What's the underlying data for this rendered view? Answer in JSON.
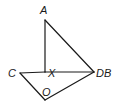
{
  "diagram": {
    "type": "geometry",
    "points": {
      "A": {
        "label": "A",
        "x": 45,
        "y": 20
      },
      "X": {
        "label": "X",
        "x": 45,
        "y": 72
      },
      "C": {
        "label": "C",
        "x": 20,
        "y": 73
      },
      "DB": {
        "label": "DB",
        "x": 94,
        "y": 72
      },
      "O": {
        "label": "O",
        "x": 45,
        "y": 100
      }
    },
    "segments": [
      [
        "A",
        "X"
      ],
      [
        "A",
        "DB"
      ],
      [
        "C",
        "X"
      ],
      [
        "X",
        "DB"
      ],
      [
        "C",
        "O"
      ],
      [
        "O",
        "DB"
      ]
    ],
    "labels": {
      "A": "A",
      "C": "C",
      "X": "X",
      "DB": "DB",
      "O": "O"
    },
    "stroke_color": "#1a1a1a"
  }
}
